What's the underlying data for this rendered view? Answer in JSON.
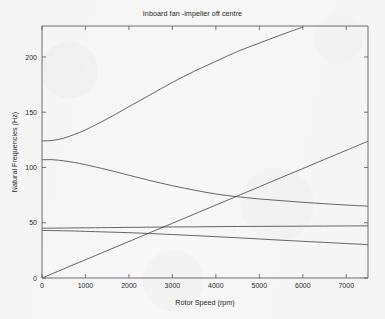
{
  "chart_data": {
    "type": "line",
    "title": "Inboard fan -impeller off centre",
    "xlabel": "Rotor Speed (rpm)",
    "ylabel": "Natural Frequencies (Hz)",
    "xlim": [
      0,
      7500
    ],
    "ylim": [
      0,
      228
    ],
    "grid": false,
    "legend": "none",
    "xticks": [
      0,
      1000,
      2000,
      3000,
      4000,
      5000,
      6000,
      7000
    ],
    "xticklabels": [
      "0",
      "1000",
      "2000",
      "3000",
      "4000",
      "5000",
      "6000",
      "7000"
    ],
    "yticks": [
      0,
      50,
      100,
      150,
      200
    ],
    "yticklabels": [
      "0",
      "50",
      "100",
      "150",
      "200"
    ],
    "x": [
      0,
      250,
      500,
      750,
      1000,
      1500,
      2000,
      2500,
      3000,
      3500,
      4000,
      4500,
      5000,
      5500,
      6000,
      6500,
      7000,
      7500
    ],
    "series": [
      {
        "name": "Mode 5 - forward whirl (rising)",
        "values": [
          124,
          124.5,
          126.5,
          130,
          134,
          144,
          155,
          166,
          177,
          187,
          196,
          205,
          212.5,
          220,
          227,
          null,
          null,
          null
        ]
      },
      {
        "name": "Mode 4 - backward whirl (falling)",
        "values": [
          107,
          107,
          106,
          104.5,
          102.5,
          98,
          93,
          88,
          83.5,
          79.5,
          76,
          73.5,
          71.5,
          70,
          68.5,
          67.2,
          66,
          65
        ]
      },
      {
        "name": "Mode 3 - near constant",
        "values": [
          45,
          45.1,
          45.2,
          45.3,
          45.4,
          45.6,
          45.8,
          46,
          46.2,
          46.3,
          46.5,
          46.6,
          46.7,
          46.8,
          46.9,
          47,
          47.1,
          47.2
        ]
      },
      {
        "name": "Mode 2 - slowly falling",
        "values": [
          43,
          42.9,
          42.7,
          42.5,
          42.2,
          41.6,
          41,
          40.2,
          39.3,
          38.4,
          37.4,
          36.4,
          35.3,
          34.2,
          33.2,
          32.2,
          31.2,
          30.2
        ]
      },
      {
        "name": "1X synchronous excitation line",
        "values": [
          0,
          4.1,
          8.3,
          12.4,
          16.5,
          24.8,
          33,
          41.3,
          49.5,
          57.8,
          66,
          74.3,
          82.5,
          90.8,
          99,
          107.3,
          115.5,
          123.8
        ]
      }
    ]
  },
  "colors": {
    "background": "#f7f7f7",
    "axis": "#5e5e5e",
    "curve": "#4a4a4a",
    "text": "#1f1f1f"
  }
}
